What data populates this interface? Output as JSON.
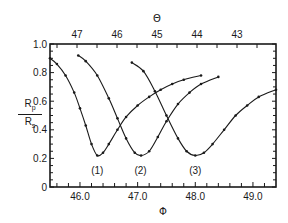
{
  "chart_data": {
    "type": "line",
    "title": "",
    "xlabel": "Φ",
    "x2label": "Θ",
    "ylabel": "Rp/Rs",
    "ylabel_parts": {
      "num_main": "R",
      "num_sub": "p",
      "den_main": "R",
      "den_sub": "s"
    },
    "xlim": [
      45.48,
      49.4
    ],
    "ylim": [
      0,
      1.0
    ],
    "x_ticks": [
      {
        "value": 46.0,
        "label": "46.0"
      },
      {
        "value": 47.0,
        "label": "47.0"
      },
      {
        "value": 48.0,
        "label": "48.0"
      },
      {
        "value": 49.0,
        "label": "49.0"
      }
    ],
    "x2_ticks": [
      {
        "value": 47,
        "label": "47"
      },
      {
        "value": 46,
        "label": "46"
      },
      {
        "value": 45,
        "label": "45"
      },
      {
        "value": 44,
        "label": "44"
      },
      {
        "value": 43,
        "label": "43"
      }
    ],
    "y_ticks": [
      {
        "value": 0,
        "label": "0"
      },
      {
        "value": 0.2,
        "label": "0.2"
      },
      {
        "value": 0.4,
        "label": "0.4"
      },
      {
        "value": 0.6,
        "label": "0.6"
      },
      {
        "value": 0.8,
        "label": "0.8"
      },
      {
        "value": 1.0,
        "label": "1.0"
      }
    ],
    "grid": false,
    "legend": "none (curves labeled inline)",
    "series": [
      {
        "name": "(1)",
        "style": "solid line with dot markers",
        "x": [
          45.48,
          45.6,
          45.75,
          45.9,
          46.0,
          46.1,
          46.2,
          46.3,
          46.4,
          46.5,
          46.65,
          46.8,
          47.0,
          47.2,
          47.4,
          47.6,
          47.8,
          48.1
        ],
        "y": [
          0.9,
          0.86,
          0.78,
          0.66,
          0.55,
          0.43,
          0.3,
          0.22,
          0.24,
          0.3,
          0.4,
          0.49,
          0.57,
          0.63,
          0.68,
          0.72,
          0.75,
          0.78
        ]
      },
      {
        "name": "(2)",
        "style": "solid line with dot markers",
        "x": [
          45.97,
          46.1,
          46.3,
          46.5,
          46.65,
          46.8,
          46.95,
          47.06,
          47.2,
          47.35,
          47.5,
          47.7,
          47.9,
          48.1,
          48.4
        ],
        "y": [
          0.92,
          0.88,
          0.78,
          0.62,
          0.48,
          0.34,
          0.24,
          0.22,
          0.25,
          0.35,
          0.46,
          0.58,
          0.66,
          0.72,
          0.77
        ]
      },
      {
        "name": "(3)",
        "style": "solid line with dot markers",
        "x": [
          46.9,
          47.1,
          47.3,
          47.5,
          47.7,
          47.85,
          48.0,
          48.15,
          48.3,
          48.5,
          48.7,
          48.9,
          49.1,
          49.4
        ],
        "y": [
          0.87,
          0.81,
          0.67,
          0.5,
          0.34,
          0.25,
          0.22,
          0.24,
          0.3,
          0.4,
          0.5,
          0.57,
          0.63,
          0.68
        ]
      }
    ],
    "annotations": [
      {
        "text": "(1)",
        "x": 46.3,
        "y": 0.12
      },
      {
        "text": "(2)",
        "x": 47.05,
        "y": 0.12
      },
      {
        "text": "(3)",
        "x": 48.0,
        "y": 0.12
      }
    ]
  }
}
